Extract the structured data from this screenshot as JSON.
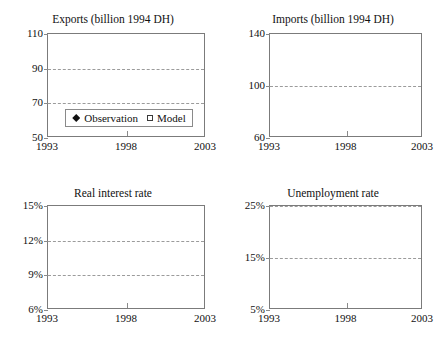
{
  "figure": {
    "background": "#ffffff",
    "marker_colors": {
      "observation": "#111111",
      "model_fill": "#ffffff",
      "model_edge": "#3a3a3a",
      "grid": "#9b9b9b",
      "frame": "#7b7b7b"
    }
  },
  "legend": {
    "observation_label": "Observation",
    "model_label": "Model",
    "observation_marker": "filled-diamond",
    "model_marker": "open-square",
    "position": "inside-bottom-of-panel-1"
  },
  "chart_data": [
    {
      "type": "scatter",
      "panel": "top-left",
      "title": "Exports (billion 1994 DH)",
      "xlabel": "",
      "ylabel": "",
      "xlim": [
        1993,
        2003
      ],
      "ylim": [
        50,
        110
      ],
      "yticks": [
        50,
        70,
        90,
        110
      ],
      "ytick_labels": [
        "50",
        "70",
        "90",
        "110"
      ],
      "xticks": [
        1993,
        1998,
        2003
      ],
      "xtick_labels": [
        "1993",
        "1998",
        "2003"
      ],
      "gridlines_y": [
        70,
        90
      ],
      "grid": true,
      "x": [
        1993.8,
        1994.8,
        1995.8,
        1996.9,
        1997.9,
        1998.9,
        1999.9,
        2000.8,
        2001.8
      ],
      "series": [
        {
          "name": "Observation",
          "marker": "filled-diamond",
          "values": [
            70.3,
            75.6,
            75.8,
            82.5,
            84.0,
            90.5,
            95.5,
            96.4,
            101.8
          ]
        },
        {
          "name": "Model",
          "marker": "open-square",
          "values": [
            70.2,
            69.1,
            71.3,
            81.3,
            82.4,
            83.7,
            90.2,
            91.6,
            94.8
          ]
        }
      ]
    },
    {
      "type": "scatter",
      "panel": "top-right",
      "title": "Imports (billion 1994 DH)",
      "xlabel": "",
      "ylabel": "",
      "xlim": [
        1993,
        2003
      ],
      "ylim": [
        60,
        140
      ],
      "yticks": [
        60,
        100,
        140
      ],
      "ytick_labels": [
        "60",
        "100",
        "140"
      ],
      "xticks": [
        1993,
        1998,
        2003
      ],
      "xtick_labels": [
        "1993",
        "1998",
        "2003"
      ],
      "gridlines_y": [
        100
      ],
      "grid": true,
      "x": [
        1993.8,
        1994.8,
        1995.8,
        1996.9,
        1997.9,
        1998.9,
        1999.9,
        2000.8,
        2001.8
      ],
      "series": [
        {
          "name": "Observation",
          "marker": "filled-diamond",
          "values": [
            86.0,
            89.5,
            87.8,
            93.5,
            100.2,
            98.2,
            120.5,
            120.2,
            126.5
          ]
        },
        {
          "name": "Model",
          "marker": "open-square",
          "values": [
            86.0,
            85.5,
            87.8,
            99.5,
            100.2,
            98.8,
            107.5,
            116.0,
            113.0
          ]
        }
      ]
    },
    {
      "type": "scatter",
      "panel": "bottom-left",
      "title": "Real interest rate",
      "xlabel": "",
      "ylabel": "",
      "xlim": [
        1993,
        2003
      ],
      "ylim": [
        6,
        15
      ],
      "yticks": [
        6,
        9,
        12,
        15
      ],
      "ytick_labels": [
        "6%",
        "9%",
        "12%",
        "15%"
      ],
      "xticks": [
        1993,
        1998,
        2003
      ],
      "xtick_labels": [
        "1993",
        "1998",
        "2003"
      ],
      "gridlines_y": [
        9,
        12
      ],
      "grid": true,
      "x": [
        1993.8,
        1994.8,
        1995.8,
        1996.9,
        1997.9,
        1998.9,
        1999.9,
        2000.8,
        2001.8
      ],
      "series": [
        {
          "name": "Observation",
          "marker": "filled-diamond",
          "values": [
            9.5,
            null,
            9.55,
            null,
            null,
            12.4,
            11.6,
            10.3,
            12.45
          ]
        },
        {
          "name": "Model",
          "marker": "open-square",
          "values": [
            null,
            9.4,
            null,
            9.6,
            9.65,
            9.7,
            9.9,
            null,
            10.1
          ]
        }
      ]
    },
    {
      "type": "scatter",
      "panel": "bottom-right",
      "title": "Unemployment rate",
      "xlabel": "",
      "ylabel": "",
      "xlim": [
        1993,
        2003
      ],
      "ylim": [
        5,
        25
      ],
      "yticks": [
        5,
        15,
        25
      ],
      "ytick_labels": [
        "5%",
        "15%",
        "25%"
      ],
      "xticks": [
        1993,
        1998,
        2003
      ],
      "xtick_labels": [
        "1993",
        "1998",
        "2003"
      ],
      "gridlines_y": [
        15,
        25
      ],
      "grid": true,
      "x": [
        1993.8,
        1994.8,
        1995.8,
        1996.9,
        1997.9,
        1998.9,
        1999.9,
        2000.8,
        2001.8
      ],
      "series": [
        {
          "name": "Observation",
          "marker": "filled-diamond",
          "values": [
            null,
            22.3,
            17.9,
            16.6,
            null,
            22.1,
            21.8,
            null,
            18.1
          ]
        },
        {
          "name": "Model",
          "marker": "open-square",
          "values": [
            22.4,
            20.5,
            24.1,
            18.4,
            19.2,
            18.5,
            18.4,
            15.0,
            null
          ]
        }
      ]
    }
  ]
}
